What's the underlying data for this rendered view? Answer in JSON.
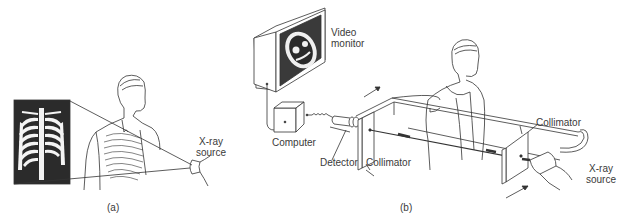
{
  "panel_a": {
    "caption": "(a)",
    "labels": {
      "xray_source_line1": "X-ray",
      "xray_source_line2": "source"
    }
  },
  "panel_b": {
    "caption": "(b)",
    "labels": {
      "video_monitor_line1": "Video",
      "video_monitor_line2": "monitor",
      "computer": "Computer",
      "detector": "Detector",
      "collimator_left": "Collimator",
      "collimator_right": "Collimator",
      "xray_source_line1": "X-ray",
      "xray_source_line2": "source"
    }
  },
  "colors": {
    "ink": "#333333",
    "film_dark": "#2a2a2a",
    "background": "#ffffff"
  }
}
